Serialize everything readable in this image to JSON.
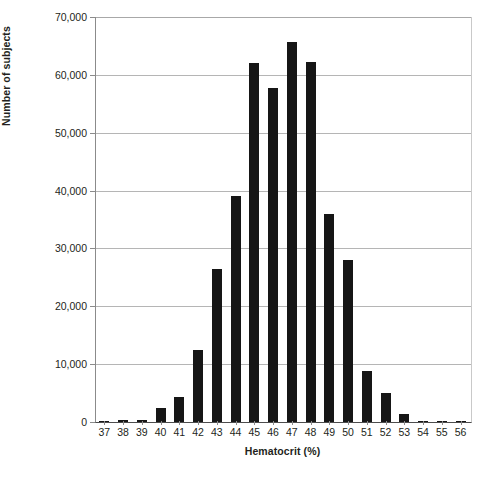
{
  "chart_data": {
    "type": "bar",
    "title": "",
    "xlabel": "Hematocrit (%)",
    "ylabel": "Number of subjects",
    "categories": [
      "37",
      "38",
      "39",
      "40",
      "41",
      "42",
      "43",
      "44",
      "45",
      "46",
      "47",
      "48",
      "49",
      "50",
      "51",
      "52",
      "53",
      "54",
      "55",
      "56"
    ],
    "values": [
      200,
      300,
      300,
      2500,
      4400,
      12500,
      26400,
      39100,
      62000,
      57800,
      65600,
      62300,
      36000,
      28000,
      8900,
      5000,
      1300,
      250,
      250,
      150
    ],
    "ylim": [
      0,
      70000
    ],
    "yticks": [
      0,
      10000,
      20000,
      30000,
      40000,
      50000,
      60000,
      70000
    ],
    "ytick_labels": [
      "0",
      "10,000",
      "20,000",
      "30,000",
      "40,000",
      "50,000",
      "60,000",
      "70,000"
    ],
    "grid": true,
    "legend": "none",
    "bar_color": "#161616",
    "grid_color": "#b5b5b5",
    "axis_color": "#8b8b8b"
  },
  "caption": {
    "text": ""
  }
}
